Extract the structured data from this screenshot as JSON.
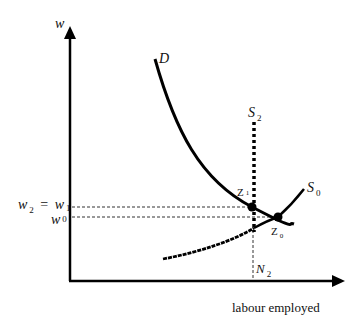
{
  "diagram": {
    "type": "labour market supply-demand diagram",
    "axes": {
      "y_label": "w",
      "x_label": "labour employed"
    },
    "curves": [
      {
        "id": "D",
        "label": "D",
        "kind": "demand",
        "style": "solid"
      },
      {
        "id": "S0",
        "label": "S",
        "sub": "0",
        "kind": "supply",
        "style": "solid"
      },
      {
        "id": "S2",
        "label": "S",
        "sub": "2",
        "kind": "vertical supply",
        "style": "dotted"
      }
    ],
    "points": [
      {
        "id": "Z1",
        "label": "Z",
        "sub": "1"
      },
      {
        "id": "Z0",
        "label": "Z",
        "sub": "0"
      }
    ],
    "y_ticks": {
      "w2_eq_w1": {
        "left": "w",
        "left_sub": "2",
        "eq": "=",
        "right": "w",
        "right_sub": "1"
      },
      "w0": {
        "label": "w",
        "sub": "0"
      }
    },
    "x_ticks": {
      "N2": {
        "label": "N",
        "sub": "2"
      }
    }
  }
}
